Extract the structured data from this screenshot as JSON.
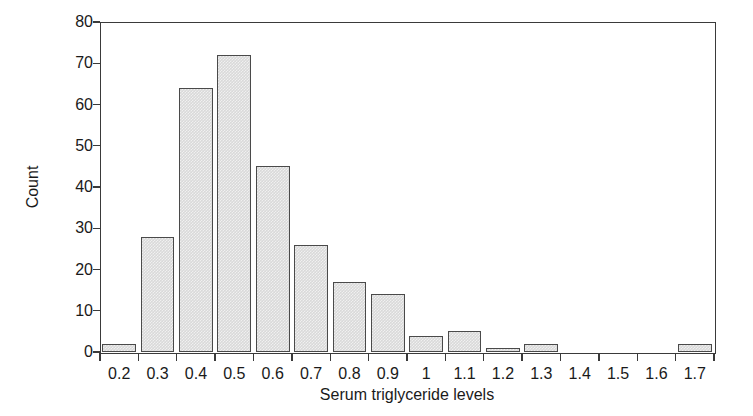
{
  "chart_data": {
    "type": "bar",
    "title": "",
    "subtitle": "",
    "xlabel": "Serum triglyceride levels",
    "ylabel": "Count",
    "categories": [
      "0.2",
      "0.3",
      "0.4",
      "0.5",
      "0.6",
      "0.7",
      "0.8",
      "0.9",
      "1",
      "1.1",
      "1.2",
      "1.3",
      "1.4",
      "1.5",
      "1.6",
      "1.7"
    ],
    "values": [
      2,
      28,
      64,
      72,
      45,
      26,
      17,
      14,
      4,
      5,
      1,
      2,
      0,
      0,
      0,
      2
    ],
    "series": [
      {
        "name": "Count",
        "values": [
          2,
          28,
          64,
          72,
          45,
          26,
          17,
          14,
          4,
          5,
          1,
          2,
          0,
          0,
          0,
          2
        ]
      }
    ],
    "xlim": [
      0.15,
      1.75
    ],
    "ylim": [
      0,
      80
    ],
    "y_ticks": [
      0,
      10,
      20,
      30,
      40,
      50,
      60,
      70,
      80
    ],
    "x_tick_labels": [
      "0.2",
      "0.3",
      "0.4",
      "0.5",
      "0.6",
      "0.7",
      "0.8",
      "0.9",
      "1",
      "1.1",
      "1.2",
      "1.3",
      "1.4",
      "1.5",
      "1.6",
      "1.7"
    ],
    "grid": false,
    "legend": false,
    "legend_position": "none",
    "bar_fill_color": "#d9d9d9",
    "bar_edge_color": "#4a4a4a",
    "axis_color": "#3a3a3a",
    "background_color": "#ffffff",
    "annotations": []
  }
}
